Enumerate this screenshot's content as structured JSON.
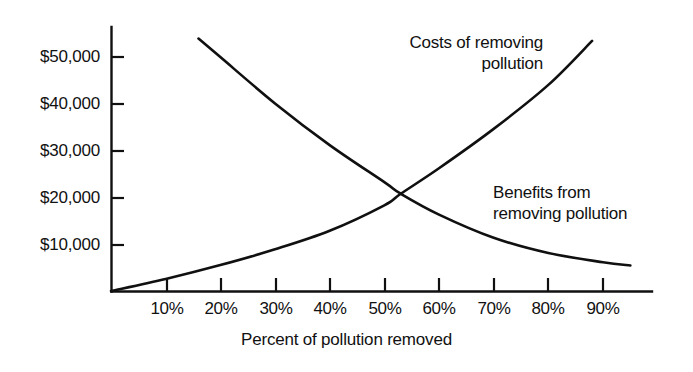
{
  "chart_data": {
    "type": "line",
    "title": "",
    "subtitle": "",
    "xlabel": "Percent  of pollution removed",
    "ylabel": "",
    "xlim": [
      0,
      100
    ],
    "ylim": [
      0,
      57000
    ],
    "grid": false,
    "legend_position": "inline-annotations",
    "x_tick_labels": [
      "10%",
      "20%",
      "30%",
      "40%",
      "50%",
      "60%",
      "70%",
      "80%",
      "90%"
    ],
    "x_tick_values": [
      10,
      20,
      30,
      40,
      50,
      60,
      70,
      80,
      90
    ],
    "y_tick_labels": [
      "$50,000",
      "$40,000",
      "$30,000",
      "$20,000",
      "$10,000"
    ],
    "y_tick_values": [
      50000,
      40000,
      30000,
      20000,
      10000
    ],
    "series": [
      {
        "name": "Costs of removing pollution",
        "annotation": "Costs of removing\npollution",
        "color": "#101010",
        "x": [
          0,
          10,
          20,
          30,
          40,
          50,
          53,
          60,
          70,
          80,
          88
        ],
        "values": [
          0,
          2600,
          5600,
          9000,
          13000,
          18500,
          21000,
          26500,
          35000,
          44500,
          54000
        ]
      },
      {
        "name": "Benefits from removing pollution",
        "annotation": "Benefits from\nremoving pollution",
        "color": "#101010",
        "x": [
          16,
          20,
          30,
          40,
          50,
          53,
          60,
          70,
          80,
          90,
          95
        ],
        "values": [
          54500,
          50500,
          40500,
          31500,
          23500,
          21000,
          16500,
          11500,
          8200,
          6200,
          5500
        ]
      }
    ],
    "intersection": {
      "x": 53,
      "y": 21000
    }
  },
  "axis_geometry": {
    "plot_left": 111,
    "plot_baseline": 291,
    "plot_right": 652,
    "plot_top": 27,
    "y_value_per_pixel_top": 57000
  },
  "tick_labels": {
    "y": [
      {
        "label": "$50,000",
        "top": 48
      },
      {
        "label": "$40,000",
        "top": 95
      },
      {
        "label": "$30,000",
        "top": 142
      },
      {
        "label": "$20,000",
        "top": 189
      },
      {
        "label": "$10,000",
        "top": 236
      }
    ],
    "x": [
      {
        "label": "10%",
        "left": 167
      },
      {
        "label": "20%",
        "left": 221
      },
      {
        "label": "30%",
        "left": 276
      },
      {
        "label": "40%",
        "left": 330
      },
      {
        "label": "50%",
        "left": 385
      },
      {
        "label": "60%",
        "left": 439
      },
      {
        "label": "70%",
        "left": 494
      },
      {
        "label": "80%",
        "left": 548
      },
      {
        "label": "90%",
        "left": 603
      }
    ]
  }
}
